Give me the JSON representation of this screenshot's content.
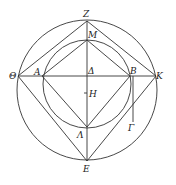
{
  "diagram": {
    "type": "geometric-construction",
    "outer_circle": {
      "cx": 87,
      "cy": 90,
      "r": 70
    },
    "inner_circle": {
      "cx": 87,
      "cy": 84,
      "r": 44
    },
    "points": {
      "Z": {
        "label": "Z",
        "x": 87,
        "y": 21
      },
      "M": {
        "label": "M",
        "x": 87,
        "y": 40
      },
      "Theta": {
        "label": "Θ",
        "x": 18,
        "y": 76
      },
      "A": {
        "label": "A",
        "x": 42,
        "y": 76
      },
      "Delta": {
        "label": "Δ",
        "x": 87,
        "y": 76
      },
      "B": {
        "label": "B",
        "x": 130,
        "y": 76
      },
      "K": {
        "label": "K",
        "x": 156,
        "y": 76
      },
      "H": {
        "label": "H",
        "x": 87,
        "y": 93
      },
      "Lambda": {
        "label": "Λ",
        "x": 87,
        "y": 127
      },
      "Gamma": {
        "label": "Γ",
        "x": 133,
        "y": 122
      },
      "E": {
        "label": "E",
        "x": 87,
        "y": 161
      }
    }
  }
}
